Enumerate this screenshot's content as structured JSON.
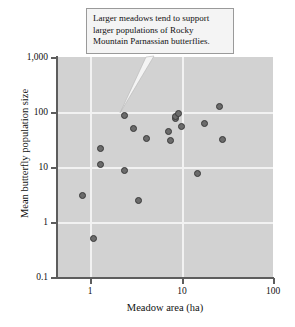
{
  "chart_data": {
    "type": "scatter",
    "title": "",
    "xlabel": "Meadow area (ha)",
    "ylabel": "Mean butterfly population size",
    "xscale": "log",
    "yscale": "log",
    "xlim": [
      0.7,
      100
    ],
    "ylim": [
      0.1,
      1000
    ],
    "xticks": [
      "1",
      "10",
      "100"
    ],
    "xtick_values": [
      1,
      10,
      100
    ],
    "yticks": [
      "1,000",
      "100",
      "10",
      "1",
      "0.1"
    ],
    "ytick_values": [
      1000,
      100,
      10,
      1,
      0.1
    ],
    "grid": true,
    "legend": "none",
    "marker": "filled-circle",
    "marker_color": "#6b6b6b",
    "plot_background": "#d2d2d2",
    "points": [
      {
        "x": 0.82,
        "y": 3.0
      },
      {
        "x": 1.1,
        "y": 0.5
      },
      {
        "x": 1.3,
        "y": 22.0
      },
      {
        "x": 1.3,
        "y": 11.0
      },
      {
        "x": 2.4,
        "y": 88.0
      },
      {
        "x": 2.4,
        "y": 8.8
      },
      {
        "x": 3.0,
        "y": 50.0
      },
      {
        "x": 3.4,
        "y": 2.5
      },
      {
        "x": 4.1,
        "y": 33.0
      },
      {
        "x": 7.2,
        "y": 45.0
      },
      {
        "x": 7.6,
        "y": 30.0
      },
      {
        "x": 8.5,
        "y": 76.0
      },
      {
        "x": 8.7,
        "y": 84.0
      },
      {
        "x": 9.2,
        "y": 92.0
      },
      {
        "x": 10.0,
        "y": 55.0
      },
      {
        "x": 15.0,
        "y": 7.7
      },
      {
        "x": 18.0,
        "y": 62.0
      },
      {
        "x": 26.0,
        "y": 125.0
      },
      {
        "x": 28.0,
        "y": 32.0
      }
    ],
    "annotations": [
      {
        "text": "Larger meadows tend to support larger populations of Rocky Mountain Parnassian butterflies.",
        "lines": [
          "Larger meadows tend to support",
          "larger populations of Rocky",
          "Mountain Parnassian butterflies."
        ],
        "points_to": {
          "x": 9.0,
          "y": 100
        }
      }
    ]
  }
}
